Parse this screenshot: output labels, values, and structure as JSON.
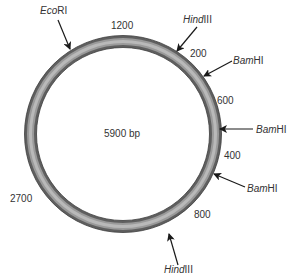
{
  "plasmid": {
    "size_label": "5900 bp",
    "ring_color": "#6e6e6e",
    "ring_highlight": "#b8b8b8",
    "sites": [
      {
        "italic": "Eco",
        "roman": "RI",
        "label": "EcoRI"
      },
      {
        "italic": "Hind",
        "roman": "III",
        "label": "HindIII"
      },
      {
        "italic": "Bam",
        "roman": "HI",
        "label": "BamHI"
      },
      {
        "italic": "Bam",
        "roman": "HI",
        "label": "BamHI"
      },
      {
        "italic": "Bam",
        "roman": "HI",
        "label": "BamHI"
      },
      {
        "italic": "Hind",
        "roman": "III",
        "label": "HindIII"
      }
    ],
    "fragments": [
      "1200",
      "200",
      "600",
      "400",
      "800",
      "2700"
    ]
  }
}
